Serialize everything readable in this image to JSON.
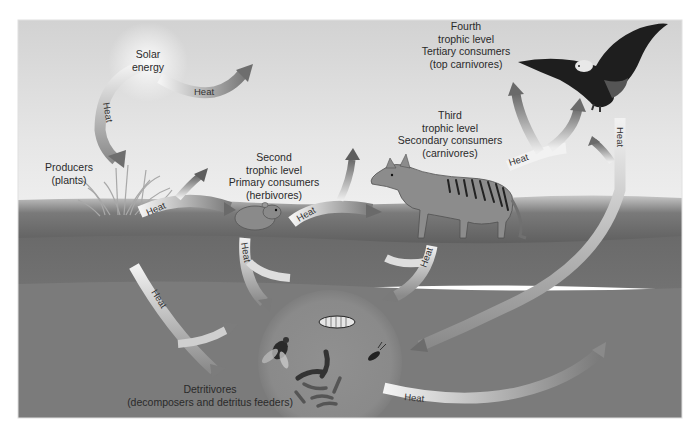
{
  "diagram": {
    "type": "energy-flow-food-chain",
    "style": {
      "palette": "grayscale",
      "sky_color": "#dcdcdc",
      "grass_color": "#6e6e6e",
      "soil_color": "#7a7a7a",
      "arrow_color": "#f2f2f2"
    },
    "labels": {
      "solar": {
        "lines": [
          "Solar",
          "energy"
        ]
      },
      "producers": {
        "lines": [
          "Producers",
          "(plants)"
        ]
      },
      "second": {
        "lines": [
          "Second",
          "trophic level",
          "Primary consumers",
          "(herbivores)"
        ]
      },
      "third": {
        "lines": [
          "Third",
          "trophic level",
          "Secondary consumers",
          "(carnivores)"
        ]
      },
      "fourth": {
        "lines": [
          "Fourth",
          "trophic level",
          "Tertiary consumers",
          "(top carnivores)"
        ]
      },
      "detritivores": {
        "lines": [
          "Detritivores",
          "(decomposers and detritus feeders)"
        ]
      }
    },
    "arrow_label": "Heat",
    "heat_arrows": [
      {
        "id": "solar-to-sky",
        "label": "Heat"
      },
      {
        "id": "solar-to-producers",
        "label": "Heat"
      },
      {
        "id": "producers-to-herbivore",
        "label": "Heat"
      },
      {
        "id": "producers-to-detritivores",
        "label": "Heat"
      },
      {
        "id": "herbivore-to-carnivore",
        "label": "Heat"
      },
      {
        "id": "herbivore-to-detritivores",
        "label": "Heat"
      },
      {
        "id": "carnivore-to-top",
        "label": "Heat"
      },
      {
        "id": "carnivore-to-detritivores",
        "label": "Heat"
      },
      {
        "id": "top-to-detritivores",
        "label": "Heat"
      },
      {
        "id": "detritivores-out",
        "label": "Heat"
      }
    ],
    "organisms": [
      {
        "role": "producer",
        "depiction": "grass plants"
      },
      {
        "role": "primary consumer",
        "depiction": "rodent (vole)"
      },
      {
        "role": "secondary consumer",
        "depiction": "thylacine (striped carnivore)"
      },
      {
        "role": "tertiary consumer",
        "depiction": "bald eagle"
      },
      {
        "role": "detritivores",
        "depiction": "fly, worms, larva, beetle"
      }
    ]
  }
}
